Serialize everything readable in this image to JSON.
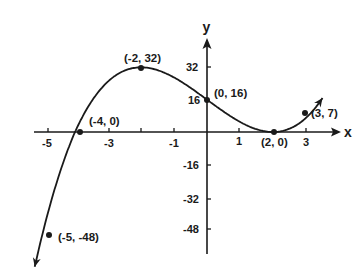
{
  "chart_data": {
    "type": "line",
    "title": "",
    "function": "f(x) = (x + 4)(x - 2)^2",
    "xlabel": "x",
    "ylabel": "y",
    "xlim": [
      -5.5,
      4
    ],
    "ylim": [
      -56,
      48
    ],
    "grid": false,
    "legend": null,
    "x_ticks": [
      -5,
      -4,
      -3,
      -2,
      -1,
      1,
      2,
      3
    ],
    "x_tick_labels": [
      {
        "value": -5,
        "label": "-5"
      },
      {
        "value": -3,
        "label": "-3"
      },
      {
        "value": -1,
        "label": "-1"
      },
      {
        "value": 1,
        "label": "1"
      },
      {
        "value": 3,
        "label": "3"
      }
    ],
    "y_ticks": [
      32,
      16,
      -16,
      -32,
      -48
    ],
    "y_tick_labels": [
      {
        "value": 32,
        "label": "32"
      },
      {
        "value": 16,
        "label": "16"
      },
      {
        "value": -16,
        "label": "-16"
      },
      {
        "value": -32,
        "label": "-32"
      },
      {
        "value": -48,
        "label": "-48"
      }
    ],
    "series": [
      {
        "name": "curve",
        "x": [
          -5,
          -4,
          -2,
          0,
          2,
          3
        ],
        "y": [
          -48,
          0,
          32,
          16,
          0,
          7
        ]
      }
    ],
    "annotations": [
      {
        "x": -5,
        "y": -48,
        "label": "(-5, -48)"
      },
      {
        "x": -4,
        "y": 0,
        "label": "(-4, 0)"
      },
      {
        "x": -2,
        "y": 32,
        "label": "(-2, 32)"
      },
      {
        "x": 0,
        "y": 16,
        "label": "(0, 16)"
      },
      {
        "x": 2,
        "y": 0,
        "label": "(2, 0)"
      },
      {
        "x": 3,
        "y": 7,
        "label": "(3, 7)"
      }
    ]
  },
  "labels": {
    "x_axis": "x",
    "y_axis": "y",
    "pt_m5": "(-5, -48)",
    "pt_m4": "(-4, 0)",
    "pt_m2": "(-2, 32)",
    "pt_0": "(0, 16)",
    "pt_2": "(2, 0)",
    "pt_3": "(3, 7)",
    "xt_m5": "-5",
    "xt_m3": "-3",
    "xt_m1": "-1",
    "xt_1": "1",
    "xt_3": "3",
    "yt_32": "32",
    "yt_16": "16",
    "yt_m16": "-16",
    "yt_m32": "-32",
    "yt_m48": "-48"
  }
}
